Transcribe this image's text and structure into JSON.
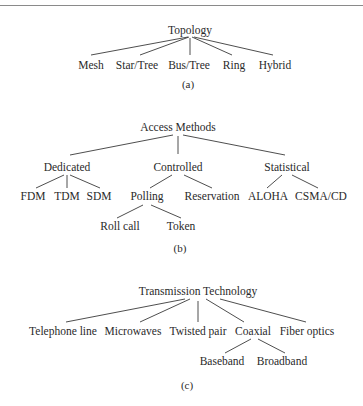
{
  "diagrams": {
    "a": {
      "caption": "(a)",
      "root": "Topology",
      "children": [
        "Mesh",
        "Star/Tree",
        "Bus/Tree",
        "Ring",
        "Hybrid"
      ]
    },
    "b": {
      "caption": "(b)",
      "root": "Access Methods",
      "children": [
        {
          "label": "Dedicated",
          "children": [
            "FDM",
            "TDM",
            "SDM"
          ]
        },
        {
          "label": "Controlled",
          "children": [
            {
              "label": "Polling",
              "children": [
                "Roll call",
                "Token"
              ]
            },
            {
              "label": "Reservation"
            }
          ]
        },
        {
          "label": "Statistical",
          "children": [
            "ALOHA",
            "CSMA/CD"
          ]
        }
      ]
    },
    "c": {
      "caption": "(c)",
      "root": "Transmission Technology",
      "children": [
        {
          "label": "Telephone line"
        },
        {
          "label": "Microwaves"
        },
        {
          "label": "Twisted pair"
        },
        {
          "label": "Coaxial",
          "children": [
            "Baseband",
            "Broadband"
          ]
        },
        {
          "label": "Fiber optics"
        }
      ]
    }
  },
  "labels": {
    "a_root": "Topology",
    "a_mesh": "Mesh",
    "a_star": "Star/Tree",
    "a_bus": "Bus/Tree",
    "a_ring": "Ring",
    "a_hybrid": "Hybrid",
    "a_caption": "(a)",
    "b_root": "Access Methods",
    "b_dedicated": "Dedicated",
    "b_controlled": "Controlled",
    "b_statistical": "Statistical",
    "b_fdm": "FDM",
    "b_tdm": "TDM",
    "b_sdm": "SDM",
    "b_polling": "Polling",
    "b_reservation": "Reservation",
    "b_aloha": "ALOHA",
    "b_csma": "CSMA/CD",
    "b_rollcall": "Roll call",
    "b_token": "Token",
    "b_caption": "(b)",
    "c_root": "Transmission Technology",
    "c_telephone": "Telephone line",
    "c_microwaves": "Microwaves",
    "c_twisted": "Twisted pair",
    "c_coaxial": "Coaxial",
    "c_fiber": "Fiber optics",
    "c_baseband": "Baseband",
    "c_broadband": "Broadband",
    "c_caption": "(c)"
  }
}
